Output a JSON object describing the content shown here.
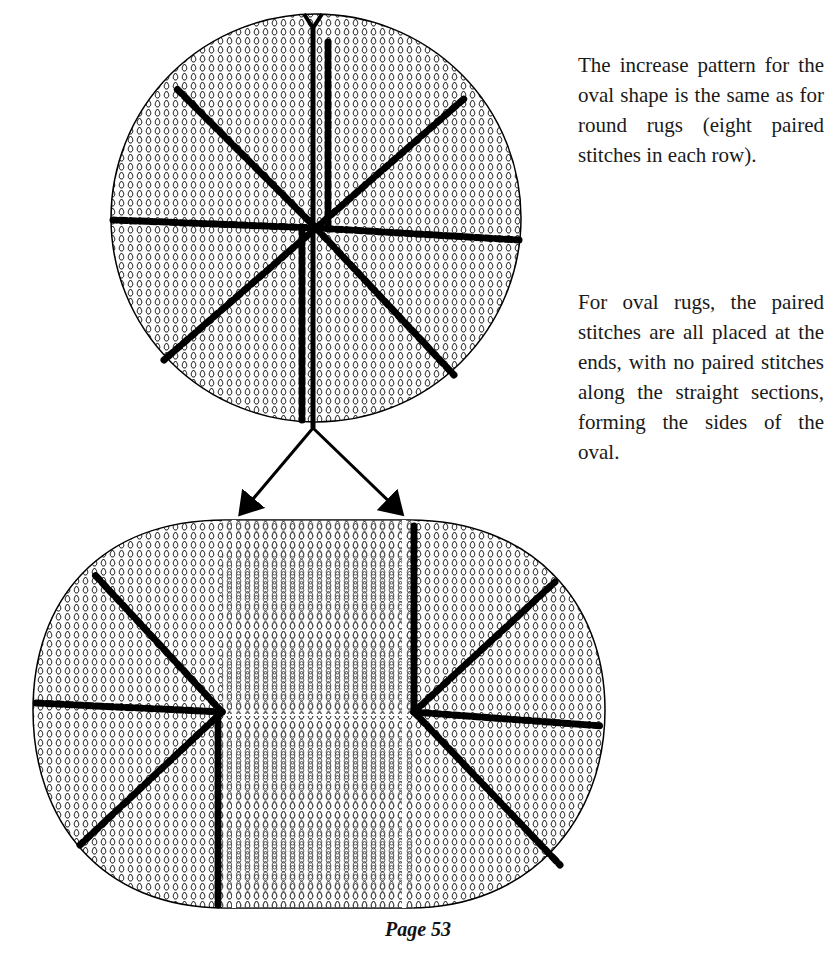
{
  "paragraphs": [
    "The increase pattern for the oval shape is the same as for round rugs (eight paired stitches in each row).",
    "For oval rugs, the paired stitches are all placed at the ends, with no paired stitches along the straight sections, forming the sides of the oval."
  ],
  "figure": {
    "top_shape": "round-rug-diagram",
    "bottom_shape": "oval-rug-diagram",
    "stitch_color": "#000000",
    "background_color": "#ffffff"
  },
  "footer": {
    "page_label": "Page 53"
  }
}
